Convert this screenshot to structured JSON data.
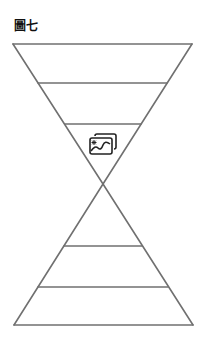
{
  "figure": {
    "title": "圖七",
    "stroke_color": "#707070",
    "icon": "image-gallery-icon"
  },
  "diagram": {
    "type": "hourglass",
    "top_triangle": {
      "orientation": "inverted",
      "tiers": 3
    },
    "bottom_triangle": {
      "orientation": "upright",
      "tiers": 3
    }
  }
}
